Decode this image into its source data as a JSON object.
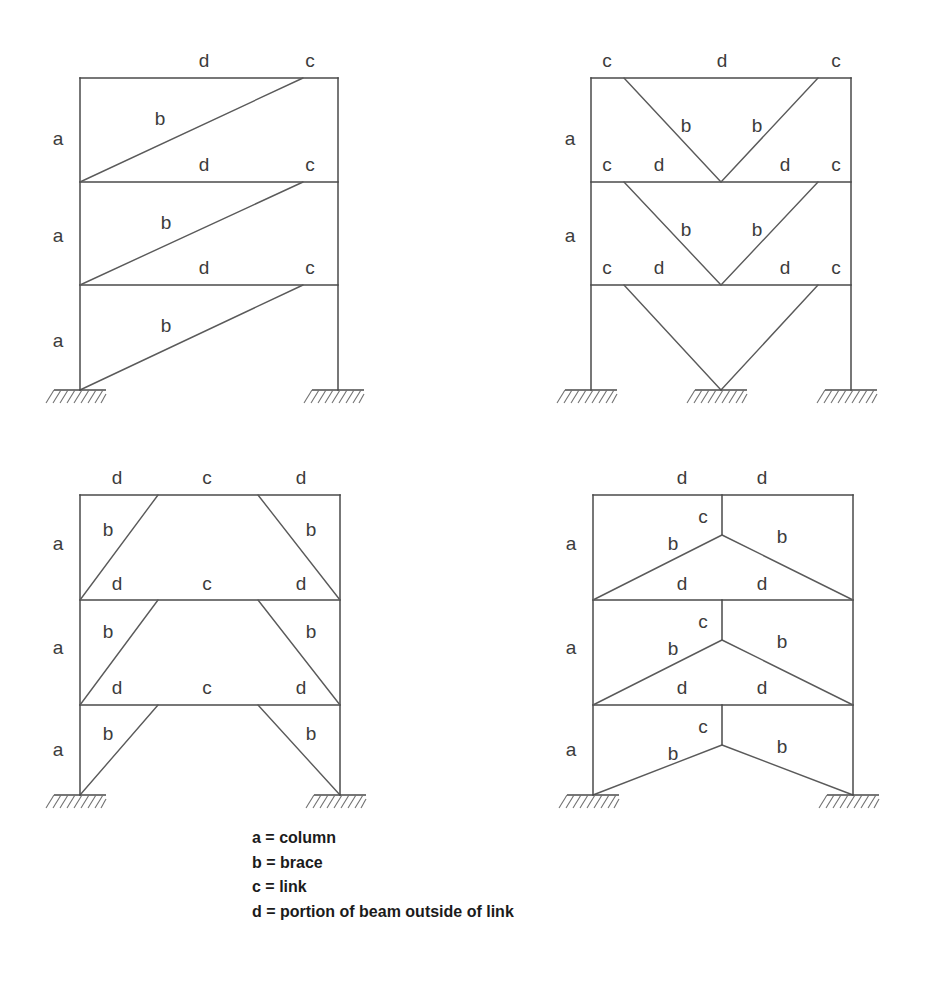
{
  "figure": {
    "kind": "engineering-diagram",
    "background_color": "#ffffff",
    "line_color": "#4a4a4a",
    "label_color": "#3c3c3c"
  },
  "legend": {
    "rows": [
      "a = column",
      "b = brace",
      "c = link",
      "d = portion of beam outside of link"
    ],
    "keys": [
      {
        "symbol": "a",
        "separator": "=",
        "meaning": "column"
      },
      {
        "symbol": "b",
        "separator": "=",
        "meaning": "brace"
      },
      {
        "symbol": "c",
        "separator": "=",
        "meaning": "link"
      },
      {
        "symbol": "d",
        "separator": "=",
        "meaning": "portion of beam outside of link"
      }
    ]
  },
  "frames": [
    {
      "id": "frame-top-left",
      "name": "diagonal-braced-frame",
      "position": "top-left",
      "stories": 3,
      "bays": 1,
      "brace_type": "single-diagonal",
      "supports": 2,
      "labels": [
        {
          "text": "d",
          "x": 204,
          "y": 62
        },
        {
          "text": "c",
          "x": 310,
          "y": 62
        },
        {
          "text": "a",
          "x": 58,
          "y": 140
        },
        {
          "text": "b",
          "x": 160,
          "y": 120
        },
        {
          "text": "d",
          "x": 204,
          "y": 166
        },
        {
          "text": "c",
          "x": 310,
          "y": 166
        },
        {
          "text": "a",
          "x": 58,
          "y": 237
        },
        {
          "text": "b",
          "x": 166,
          "y": 224
        },
        {
          "text": "d",
          "x": 204,
          "y": 269
        },
        {
          "text": "c",
          "x": 310,
          "y": 269
        },
        {
          "text": "a",
          "x": 58,
          "y": 342
        },
        {
          "text": "b",
          "x": 166,
          "y": 327
        }
      ]
    },
    {
      "id": "frame-top-right",
      "name": "inverted-v-braced-frame",
      "position": "top-right",
      "stories": 3,
      "bays": 1,
      "brace_type": "inverted-v-chevron",
      "supports": 3,
      "labels": [
        {
          "text": "c",
          "x": 607,
          "y": 62
        },
        {
          "text": "d",
          "x": 722,
          "y": 62
        },
        {
          "text": "c",
          "x": 836,
          "y": 62
        },
        {
          "text": "a",
          "x": 570,
          "y": 140
        },
        {
          "text": "b",
          "x": 686,
          "y": 127
        },
        {
          "text": "b",
          "x": 757,
          "y": 127
        },
        {
          "text": "c",
          "x": 607,
          "y": 166
        },
        {
          "text": "d",
          "x": 659,
          "y": 166
        },
        {
          "text": "d",
          "x": 785,
          "y": 166
        },
        {
          "text": "c",
          "x": 836,
          "y": 166
        },
        {
          "text": "a",
          "x": 570,
          "y": 237
        },
        {
          "text": "b",
          "x": 686,
          "y": 231
        },
        {
          "text": "b",
          "x": 757,
          "y": 231
        },
        {
          "text": "c",
          "x": 607,
          "y": 269
        },
        {
          "text": "d",
          "x": 659,
          "y": 269
        },
        {
          "text": "d",
          "x": 785,
          "y": 269
        },
        {
          "text": "c",
          "x": 836,
          "y": 269
        }
      ]
    },
    {
      "id": "frame-bottom-left",
      "name": "split-diagonal-braced-frame",
      "position": "bottom-left",
      "stories": 3,
      "bays": 1,
      "brace_type": "two-diagonal-central-link",
      "supports": 2,
      "labels": [
        {
          "text": "d",
          "x": 117,
          "y": 479
        },
        {
          "text": "c",
          "x": 207,
          "y": 479
        },
        {
          "text": "d",
          "x": 301,
          "y": 479
        },
        {
          "text": "a",
          "x": 58,
          "y": 545
        },
        {
          "text": "b",
          "x": 108,
          "y": 531
        },
        {
          "text": "b",
          "x": 311,
          "y": 531
        },
        {
          "text": "d",
          "x": 117,
          "y": 585
        },
        {
          "text": "c",
          "x": 207,
          "y": 585
        },
        {
          "text": "d",
          "x": 301,
          "y": 585
        },
        {
          "text": "a",
          "x": 58,
          "y": 649
        },
        {
          "text": "b",
          "x": 108,
          "y": 633
        },
        {
          "text": "b",
          "x": 311,
          "y": 633
        },
        {
          "text": "d",
          "x": 117,
          "y": 689
        },
        {
          "text": "c",
          "x": 207,
          "y": 689
        },
        {
          "text": "d",
          "x": 301,
          "y": 689
        },
        {
          "text": "a",
          "x": 58,
          "y": 751
        },
        {
          "text": "b",
          "x": 108,
          "y": 735
        },
        {
          "text": "b",
          "x": 311,
          "y": 735
        }
      ]
    },
    {
      "id": "frame-bottom-right",
      "name": "v-braced-frame-vertical-link",
      "position": "bottom-right",
      "stories": 3,
      "bays": 1,
      "brace_type": "v-chevron-vertical-link",
      "supports": 2,
      "labels": [
        {
          "text": "d",
          "x": 682,
          "y": 479
        },
        {
          "text": "d",
          "x": 762,
          "y": 479
        },
        {
          "text": "c",
          "x": 703,
          "y": 518
        },
        {
          "text": "a",
          "x": 571,
          "y": 545
        },
        {
          "text": "b",
          "x": 673,
          "y": 545
        },
        {
          "text": "b",
          "x": 782,
          "y": 538
        },
        {
          "text": "d",
          "x": 682,
          "y": 585
        },
        {
          "text": "d",
          "x": 762,
          "y": 585
        },
        {
          "text": "c",
          "x": 703,
          "y": 623
        },
        {
          "text": "a",
          "x": 571,
          "y": 649
        },
        {
          "text": "b",
          "x": 673,
          "y": 650
        },
        {
          "text": "b",
          "x": 782,
          "y": 643
        },
        {
          "text": "d",
          "x": 682,
          "y": 689
        },
        {
          "text": "d",
          "x": 762,
          "y": 689
        },
        {
          "text": "c",
          "x": 703,
          "y": 728
        },
        {
          "text": "a",
          "x": 571,
          "y": 751
        },
        {
          "text": "b",
          "x": 673,
          "y": 755
        },
        {
          "text": "b",
          "x": 782,
          "y": 748
        }
      ]
    }
  ],
  "geometry": {
    "top_left": {
      "left_col_x": 80,
      "right_col_x": 338,
      "roof_y": 78,
      "beam2_y": 182,
      "beam3_y": 285,
      "base_y": 390,
      "brace_top_offset": 35
    },
    "top_right": {
      "left_col_x": 591,
      "right_col_x": 851,
      "roof_y": 78,
      "beam2_y": 182,
      "beam3_y": 285,
      "base_y": 390,
      "apex_x": 721,
      "brace_top_offset": 33
    },
    "bottom_left": {
      "left_col_x": 80,
      "right_col_x": 340,
      "roof_y": 495,
      "beam2_y": 600,
      "beam3_y": 705,
      "base_y": 795,
      "link_left_x": 158,
      "link_right_x": 258
    },
    "bottom_right": {
      "left_col_x": 593,
      "right_col_x": 853,
      "roof_y": 495,
      "beam2_y": 600,
      "beam3_y": 705,
      "base_y": 795,
      "apex_x": 722,
      "apex_drop": 40
    }
  }
}
